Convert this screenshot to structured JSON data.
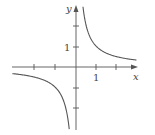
{
  "chart_data": {
    "type": "line",
    "title": "",
    "function": "y = 1/x",
    "xlabel": "x",
    "ylabel": "y",
    "xlim": [
      -3,
      3
    ],
    "ylim": [
      -3,
      3
    ],
    "grid": false,
    "x_tick_positions": [
      -2,
      -1,
      1,
      2
    ],
    "y_tick_positions": [
      -2,
      -1,
      1,
      2
    ],
    "x_tick_labels": [
      {
        "value": 1,
        "label": "1"
      }
    ],
    "y_tick_labels": [
      {
        "value": 1,
        "label": "1"
      }
    ],
    "series": [
      {
        "name": "branch-positive",
        "x": [
          0.33,
          0.5,
          1,
          1.5,
          2,
          2.9
        ],
        "y": [
          3,
          2,
          1,
          0.667,
          0.5,
          0.345
        ]
      },
      {
        "name": "branch-negative",
        "x": [
          -3,
          -2,
          -1.5,
          -1,
          -0.5,
          -0.33
        ],
        "y": [
          -0.333,
          -0.5,
          -0.667,
          -1,
          -2,
          -3
        ]
      }
    ],
    "colors": {
      "axis": "#555555",
      "curve": "#555555"
    }
  },
  "labels": {
    "x_axis": "x",
    "y_axis": "y",
    "x_one": "1",
    "y_one": "1"
  }
}
